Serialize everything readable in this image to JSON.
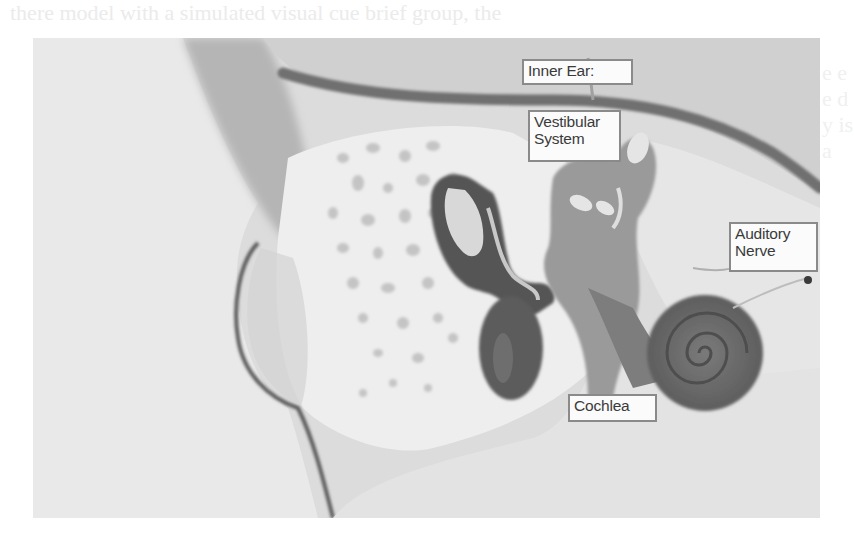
{
  "page": {
    "bleed_through_text_top": "there model with a simulated visual cue brief group, the",
    "bleed_through_text_right": "e\ne\ne\nd\ny\nis\na"
  },
  "figure": {
    "labels": {
      "inner_ear": "Inner Ear:",
      "vestibular_system_line1": "Vestibular",
      "vestibular_system_line2": "System",
      "auditory_nerve_line1": "Auditory",
      "auditory_nerve_line2": "Nerve",
      "cochlea": "Cochlea"
    },
    "colors": {
      "background": "#d9d9d9",
      "bone": "#e8e8e8",
      "dark_tissue": "#5a5a5a",
      "vestibular": "#9a9a9a",
      "cochlea": "#6e6e6e",
      "label_fill": "#fbfbfb",
      "label_border": "#8a8a8a"
    }
  }
}
